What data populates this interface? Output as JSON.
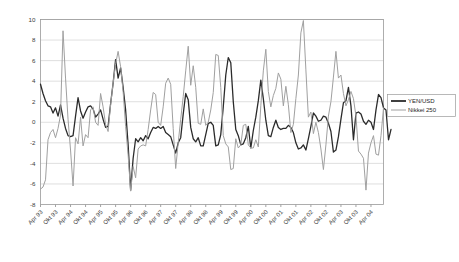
{
  "chart_data": {
    "type": "line",
    "title": "",
    "xlabel": "",
    "ylabel": "",
    "ylim": [
      -8,
      10
    ],
    "ytick_step": 2,
    "yticks": [
      "10",
      "8",
      "6",
      "4",
      "2",
      "0",
      "-2",
      "-4",
      "-6",
      "-8"
    ],
    "grid": true,
    "legend_position": "right",
    "xtick_labels": [
      "Apr 93",
      "Okt 93",
      "Apr 94",
      "Okt 94",
      "Apr 95",
      "Okt 95",
      "Apr 96",
      "Okt 96",
      "Apr 97",
      "Okt 97",
      "Apr 98",
      "Okt 98",
      "Apr 99",
      "Okt 99",
      "Apr 00",
      "Okt 00",
      "Apr 01",
      "Okt 01",
      "Apr 02",
      "Okt 02",
      "Apr 03",
      "Okt 03",
      "Apr 04"
    ],
    "xtick_interval_points": 6,
    "x_count": 138,
    "series": [
      {
        "name": "YEN/USD",
        "color": "#2b2b2b",
        "width": 1.3,
        "values": [
          3.7,
          2.8,
          2.1,
          1.6,
          1.5,
          0.9,
          1.4,
          0.6,
          1.7,
          0.4,
          -0.6,
          -1.3,
          -1.4,
          -1.3,
          0.6,
          2.4,
          1.1,
          0.4,
          1.0,
          1.5,
          1.6,
          1.3,
          0.5,
          0.8,
          1.2,
          0.3,
          -0.5,
          -0.4,
          1.8,
          3.8,
          6.1,
          4.3,
          5.3,
          3.4,
          1.2,
          -2.2,
          -6.6,
          -3.5,
          -1.6,
          -1.9,
          -1.5,
          -1.8,
          -1.3,
          -1.6,
          -1.0,
          -0.5,
          -0.6,
          -0.4,
          -0.6,
          -0.4,
          -1.0,
          -1.2,
          -1.4,
          -2.2,
          -3.0,
          -2.0,
          -1.5,
          0.8,
          2.8,
          2.2,
          -0.5,
          -1.6,
          -1.9,
          -1.5,
          -2.3,
          -2.3,
          -1.2,
          -0.1,
          0.0,
          -0.3,
          -2.3,
          -2.2,
          -1.2,
          1.5,
          4.6,
          6.3,
          5.8,
          2.0,
          -0.7,
          -1.3,
          -2.2,
          -2.1,
          -1.5,
          -0.4,
          -2.5,
          -0.8,
          0.5,
          2.1,
          4.1,
          2.3,
          0.2,
          -1.3,
          -1.4,
          -0.5,
          0.2,
          -0.5,
          -0.7,
          -0.6,
          -0.6,
          -0.3,
          -0.5,
          -1.0,
          -2.0,
          -2.6,
          -2.5,
          -2.2,
          -2.7,
          -1.6,
          -0.4,
          0.9,
          0.6,
          0.1,
          0.2,
          0.6,
          0.5,
          -0.1,
          -0.9,
          -2.9,
          -2.7,
          -1.4,
          0.3,
          1.9,
          2.1,
          3.4,
          1.6,
          -1.7,
          0.9,
          1.0,
          0.8,
          0.1,
          -0.2,
          0.2,
          0.0,
          -0.7,
          1.2,
          2.7,
          2.4,
          1.4,
          1.2,
          -1.7,
          -0.7
        ]
      },
      {
        "name": "Nikkei 250",
        "color": "#a0a0a0",
        "width": 1.0,
        "values": [
          -6.5,
          -6.3,
          -5.6,
          -1.7,
          -1.0,
          -0.7,
          -1.5,
          -0.6,
          0.7,
          8.9,
          4.3,
          0.3,
          -2.7,
          -6.2,
          -1.5,
          -2.1,
          0.5,
          -2.3,
          -1.2,
          -1.5,
          1.2,
          1.5,
          0.0,
          -0.3,
          2.8,
          1.5,
          -0.2,
          -0.9,
          1.7,
          3.8,
          5.7,
          6.9,
          5.4,
          3.0,
          -0.4,
          -3.2,
          -6.7,
          -4.3,
          -5.4,
          -2.6,
          -2.3,
          -2.2,
          -2.3,
          -0.7,
          1.2,
          2.9,
          2.7,
          0.0,
          -0.3,
          1.5,
          3.8,
          4.3,
          3.7,
          -0.6,
          -4.5,
          -2.0,
          0.3,
          2.5,
          5.0,
          7.4,
          3.6,
          5.5,
          3.4,
          -0.1,
          -0.2,
          1.3,
          -0.3,
          0.0,
          1.2,
          2.9,
          6.6,
          6.5,
          3.4,
          -1.3,
          -2.1,
          -2.4,
          -4.6,
          -4.5,
          -1.6,
          -2.5,
          -2.2,
          -0.3,
          -0.2,
          -2.2,
          -2.5,
          -2.5,
          -1.7,
          -2.4,
          1.6,
          5.0,
          7.1,
          3.0,
          1.5,
          2.6,
          3.3,
          4.8,
          4.2,
          1.6,
          3.5,
          1.7,
          -1.0,
          -0.2,
          2.3,
          4.6,
          8.7,
          9.9,
          5.1,
          0.5,
          1.0,
          -1.1,
          0.0,
          -1.0,
          -2.6,
          -4.6,
          -2.2,
          0.6,
          2.0,
          4.4,
          6.9,
          4.3,
          4.6,
          2.8,
          1.6,
          2.2,
          3.0,
          2.3,
          0.6,
          -2.8,
          -3.1,
          -3.5,
          -6.6,
          -3.0,
          -2.0,
          -1.3,
          -3.1,
          -3.2,
          -1.3,
          1.4
        ]
      }
    ]
  },
  "legend": {
    "entries": [
      {
        "label": "YEN/USD"
      },
      {
        "label": "Nikkei 250"
      }
    ]
  }
}
